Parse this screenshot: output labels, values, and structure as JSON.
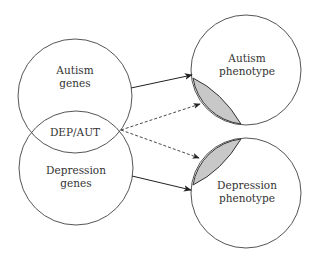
{
  "diagram": {
    "left_circles": {
      "top": {
        "line1": "Autism",
        "line2": "genes"
      },
      "overlap": {
        "label": "DEP/AUT"
      },
      "bottom": {
        "line1": "Depression",
        "line2": "genes"
      }
    },
    "right_circles": {
      "top": {
        "line1": "Autism",
        "line2": "phenotype"
      },
      "bottom": {
        "line1": "Depression",
        "line2": "phenotype"
      }
    },
    "arrows": [
      {
        "from": "Autism genes",
        "to": "Autism phenotype",
        "style": "solid"
      },
      {
        "from": "DEP/AUT",
        "to": "Autism phenotype (shaded region)",
        "style": "dashed"
      },
      {
        "from": "DEP/AUT",
        "to": "Depression phenotype (shaded region)",
        "style": "dashed"
      },
      {
        "from": "Depression genes",
        "to": "Depression phenotype",
        "style": "solid"
      }
    ],
    "colors": {
      "stroke": "#444444",
      "shaded": "#c8c8c8"
    }
  }
}
